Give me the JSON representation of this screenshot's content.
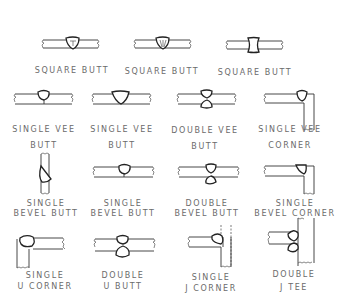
{
  "colors": {
    "line": "#333333",
    "label": "#6b6b6b",
    "background": "#ffffff"
  },
  "joints": [
    {
      "id": "square-butt-1",
      "label_line1": "SQUARE BUTT",
      "label_line2": ""
    },
    {
      "id": "square-butt-2",
      "label_line1": "SQUARE BUTT",
      "label_line2": ""
    },
    {
      "id": "square-butt-3",
      "label_line1": "SQUARE BUTT",
      "label_line2": ""
    },
    {
      "id": "single-vee-butt-1",
      "label_line1": "SINGLE VEE",
      "label_line2": "BUTT"
    },
    {
      "id": "single-vee-butt-2",
      "label_line1": "SINGLE VEE",
      "label_line2": "BUTT"
    },
    {
      "id": "double-vee-butt",
      "label_line1": "DOUBLE VEE",
      "label_line2": "BUTT"
    },
    {
      "id": "single-vee-corner",
      "label_line1": "SINGLE VEE",
      "label_line2": "CORNER"
    },
    {
      "id": "single-bevel-butt-1",
      "label_line1": "SINGLE",
      "label_line2": "BEVEL BUTT"
    },
    {
      "id": "single-bevel-butt-2",
      "label_line1": "SINGLE",
      "label_line2": "BEVEL BUTT"
    },
    {
      "id": "double-bevel-butt",
      "label_line1": "DOUBLE",
      "label_line2": "BEVEL BUTT"
    },
    {
      "id": "single-bevel-corner",
      "label_line1": "SINGLE",
      "label_line2": "BEVEL CORNER"
    },
    {
      "id": "single-u-corner",
      "label_line1": "SINGLE",
      "label_line2": "U CORNER"
    },
    {
      "id": "double-u-butt",
      "label_line1": "DOUBLE",
      "label_line2": "U BUTT"
    },
    {
      "id": "single-j-corner",
      "label_line1": "SINGLE",
      "label_line2": "J CORNER"
    },
    {
      "id": "double-j-tee",
      "label_line1": "DOUBLE",
      "label_line2": "J TEE"
    }
  ]
}
